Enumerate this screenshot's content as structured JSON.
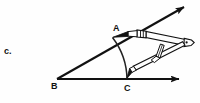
{
  "page": {
    "background_color": "#fefefe",
    "ink_color": "#111111",
    "width": 200,
    "height": 103
  },
  "item_label": {
    "text": "c.",
    "name": "figure-item-letter"
  },
  "figure": {
    "caption": "Angle construction with a compass: arc swung from vertex B through points A and C",
    "point_labels": [
      {
        "name": "A",
        "text": "A",
        "x": 117,
        "y": 29
      },
      {
        "name": "B",
        "text": "B",
        "x": 55,
        "y": 87
      },
      {
        "name": "C",
        "text": "C",
        "x": 128,
        "y": 89
      }
    ],
    "vertices": {
      "B": {
        "x": 57,
        "y": 79
      },
      "A": {
        "x": 113,
        "y": 37
      },
      "C": {
        "x": 127,
        "y": 79
      }
    },
    "rays": [
      {
        "name": "ray-B-to-A-extended",
        "from": {
          "x": 57,
          "y": 79
        },
        "to": {
          "x": 186,
          "y": 6
        },
        "arrowhead": "end"
      },
      {
        "name": "ray-B-horizontal",
        "from": {
          "x": 57,
          "y": 79
        },
        "to": {
          "x": 181,
          "y": 79
        },
        "arrowhead": "end"
      }
    ],
    "arc": {
      "name": "compass-arc-A-to-C",
      "center": {
        "x": 57,
        "y": 79
      },
      "radius": 70,
      "from_point": "A",
      "to_point": "C"
    },
    "compass": {
      "name": "drawing-compass",
      "hinge": {
        "x": 186,
        "y": 43
      },
      "needle_tip": {
        "x": 113,
        "y": 37
      },
      "pencil_tip": {
        "x": 127,
        "y": 78
      },
      "parts": [
        "needle-leg",
        "hinge",
        "pencil-leg",
        "adjustment-screw"
      ]
    }
  }
}
